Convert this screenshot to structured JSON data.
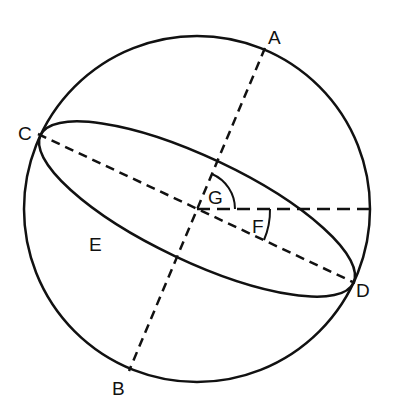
{
  "diagram": {
    "type": "sphere-geometry",
    "labels": {
      "A": "A",
      "B": "B",
      "C": "C",
      "D": "D",
      "E": "E",
      "F": "F",
      "G": "G"
    },
    "stroke_color": "#111111",
    "background": "#ffffff"
  }
}
